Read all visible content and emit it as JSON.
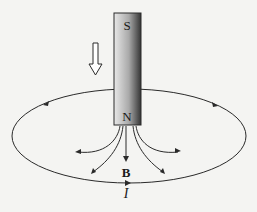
{
  "diagram": {
    "magnet": {
      "top_pole_label": "S",
      "bottom_pole_label": "N"
    },
    "motion_arrow": {
      "icon": "hollow-down-arrow",
      "meaning": "magnet moving down"
    },
    "field_label": "B",
    "current_label": "I",
    "loop": {
      "shape": "ellipse",
      "direction": "counterclockwise viewed from above"
    },
    "colors": {
      "line": "#2a2a2a",
      "magnet_light": "#e6e6e6",
      "magnet_dark": "#3c3c3c",
      "background": "#f4f4f2"
    }
  }
}
